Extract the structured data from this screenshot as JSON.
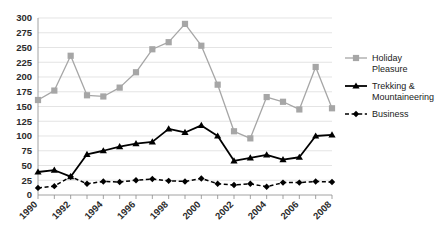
{
  "chart_data": {
    "type": "line",
    "title": "",
    "subtitle": "",
    "xlabel": "",
    "ylabel": "",
    "x": [
      1990,
      1991,
      1992,
      1993,
      1994,
      1995,
      1996,
      1997,
      1998,
      1999,
      2000,
      2001,
      2002,
      2003,
      2004,
      2005,
      2006,
      2007,
      2008
    ],
    "xlim": [
      1990,
      2008
    ],
    "ylim": [
      0,
      300
    ],
    "ytick_labels": [
      "0",
      "25",
      "50",
      "75",
      "100",
      "125",
      "150",
      "175",
      "200",
      "225",
      "250",
      "275",
      "300"
    ],
    "ytick_values": [
      0,
      25,
      50,
      75,
      100,
      125,
      150,
      175,
      200,
      225,
      250,
      275,
      300
    ],
    "xtick_labels": [
      "1990",
      "1992",
      "1994",
      "1996",
      "1998",
      "2000",
      "2002",
      "2004",
      "2006",
      "2008"
    ],
    "xtick_values": [
      1990,
      1992,
      1994,
      1996,
      1998,
      2000,
      2002,
      2004,
      2006,
      2008
    ],
    "xtick_rotation": -45,
    "grid": "horizontal",
    "legend_position": "right",
    "series": [
      {
        "name": "Holiday Pleasure",
        "color": "#a6a6a6",
        "marker": "square",
        "linestyle": "solid",
        "values": [
          161,
          177,
          236,
          169,
          167,
          182,
          208,
          247,
          259,
          290,
          253,
          187,
          108,
          96,
          166,
          158,
          145,
          217,
          147
        ]
      },
      {
        "name": "Trekking & Mountaineering",
        "color": "#000000",
        "marker": "triangle",
        "linestyle": "solid",
        "values": [
          39,
          42,
          31,
          69,
          75,
          82,
          87,
          90,
          112,
          106,
          118,
          100,
          58,
          63,
          68,
          60,
          64,
          100,
          102
        ]
      },
      {
        "name": "Business",
        "color": "#000000",
        "marker": "diamond",
        "linestyle": "dashed",
        "values": [
          12,
          15,
          31,
          19,
          23,
          22,
          25,
          27,
          24,
          23,
          28,
          19,
          17,
          19,
          14,
          21,
          21,
          23,
          22
        ]
      }
    ]
  },
  "legend": {
    "entries": [
      {
        "label_line1": "Holiday",
        "label_line2": "Pleasure",
        "full": "Holiday Pleasure"
      },
      {
        "label_line1": "Trekking &",
        "label_line2": "Mountaineering",
        "full": "Trekking & Mountaineering"
      },
      {
        "label_line1": "Business",
        "label_line2": "",
        "full": "Business"
      }
    ]
  },
  "colors": {
    "series1": "#a6a6a6",
    "series2": "#000000",
    "series3": "#000000",
    "grid": "#d9d9d9",
    "axis": "#8c8c8c",
    "text": "#2b2b2b",
    "background": "#ffffff"
  }
}
